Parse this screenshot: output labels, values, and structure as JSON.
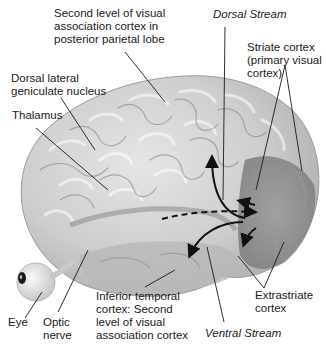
{
  "labels": {
    "second_level_parietal": "Second level of visual\nassociation cortex in\nposterior parietal lobe",
    "dorsal_stream": "Dorsal Stream",
    "striate_cortex": "Striate cortex\n(primary visual\ncortex)",
    "dorsal_lgn": "Dorsal lateral\ngeniculate nucleus",
    "thalamus": "Thalamus",
    "eye": "Eye",
    "optic_nerve": "Optic\nnerve",
    "inferior_temporal": "Inferior temporal\ncortex: Second\nlevel of visual\nassociation cortex",
    "ventral_stream": "Ventral Stream",
    "extrastriate": "Extrastriate\ncortex"
  },
  "colors": {
    "brain_fill": "#c9c9c9",
    "brain_highlight": "#e2e2e2",
    "brain_shadow": "#8f8f8f",
    "occipital_shadow": "#7a7a7a",
    "leader_line": "#1a1a1a",
    "arrow": "#111111"
  }
}
